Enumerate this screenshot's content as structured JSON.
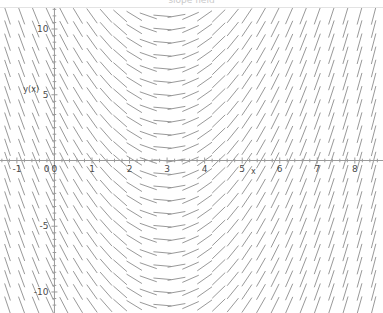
{
  "page": {
    "background_color": "#ffffff",
    "clipped_header_text": "slope field",
    "rule_color": "#e3e3e3"
  },
  "chart_data": {
    "type": "scatter",
    "plot_kind": "slope-field",
    "title": "",
    "xlabel": "x",
    "ylabel": "y(x)",
    "xlim": [
      -1.45,
      8.75
    ],
    "ylim": [
      -11.6,
      11.6
    ],
    "xticks": [
      -1,
      0,
      1,
      2,
      3,
      4,
      5,
      6,
      7,
      8
    ],
    "xtick_labels": [
      "-1",
      "0",
      "1",
      "2",
      "3",
      "4",
      "5",
      "6",
      "7",
      "8"
    ],
    "yticks": [
      -10,
      -5,
      0,
      5,
      10
    ],
    "ytick_labels": [
      "-10",
      "-5",
      "0",
      "5",
      "10"
    ],
    "grid": false,
    "legend": null,
    "axis_color": "#9a9a9a",
    "segment_color": "#8d8d8d",
    "text_color": "#4a4a4a",
    "zero_slope_x": 3,
    "slope_rule": "dy/dx proportional to (x - 3); horizontal dashes at x = 3, negative slopes for x < 3, positive slopes for x > 3, steeper with distance from x = 3",
    "sample_columns_x": [
      -1,
      0,
      1,
      2,
      3,
      4,
      5,
      6,
      7,
      8
    ],
    "sample_slopes": [
      -8,
      -6,
      -4,
      -2,
      0,
      2,
      4,
      6,
      8,
      10
    ],
    "field_columns": [
      -1.25,
      -0.875,
      -0.5,
      -0.125,
      0.25,
      0.625,
      1,
      1.375,
      1.75,
      2.125,
      2.5,
      2.875,
      3.25,
      3.625,
      4,
      4.375,
      4.75,
      5.125,
      5.5,
      5.875,
      6.25,
      6.625,
      7,
      7.375,
      7.75,
      8.125,
      8.5
    ],
    "field_rows": [
      -11,
      -10,
      -9,
      -8,
      -7,
      -6,
      -5,
      -4,
      -3,
      -2,
      -1,
      0,
      1,
      2,
      3,
      4,
      5,
      6,
      7,
      8,
      9,
      10,
      11
    ]
  },
  "axis_labels": {
    "x_axis_name": "x",
    "y_axis_name": "y(x)"
  }
}
